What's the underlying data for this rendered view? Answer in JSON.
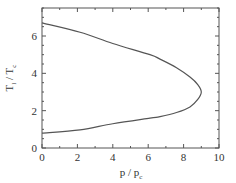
{
  "chart_data": {
    "type": "line",
    "title": "",
    "xlabel": "p / p",
    "xlabel_sub": "c",
    "ylabel": "T",
    "ylabel_sub1": "l",
    "ylabel_mid": " / T",
    "ylabel_sub2": "c",
    "xlim": [
      0,
      10
    ],
    "ylim": [
      0,
      7.5
    ],
    "xticks": [
      0,
      2,
      4,
      6,
      8,
      10
    ],
    "yticks": [
      0,
      2,
      4,
      6
    ],
    "xminor": 1,
    "yminor": 0.5,
    "grid": false,
    "legend": "none",
    "series": [
      {
        "name": "coexistence curve",
        "color": "#555555",
        "points": [
          [
            0.0,
            6.7
          ],
          [
            2.15,
            6.2
          ],
          [
            4.0,
            5.6
          ],
          [
            6.1,
            5.0
          ],
          [
            6.67,
            4.76
          ],
          [
            7.6,
            4.3
          ],
          [
            8.36,
            3.8
          ],
          [
            8.8,
            3.4
          ],
          [
            9.0,
            3.0
          ],
          [
            8.8,
            2.6
          ],
          [
            8.36,
            2.2
          ],
          [
            7.6,
            1.9
          ],
          [
            6.67,
            1.68
          ],
          [
            6.1,
            1.6
          ],
          [
            4.0,
            1.3
          ],
          [
            2.15,
            0.97
          ],
          [
            0.0,
            0.8
          ]
        ]
      }
    ]
  }
}
